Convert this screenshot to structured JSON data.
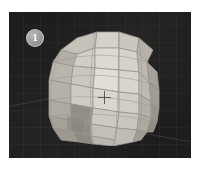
{
  "figure": {
    "name": "3d-viewport-figure",
    "badge_label": "1",
    "badge_title": "Panel 1",
    "caption": ""
  },
  "viewport": {
    "name": "3d-viewport",
    "background_color": "#1d1d1d",
    "grid_visible": true,
    "grid_color": "#787878",
    "cursor_label": "3D cursor"
  },
  "object": {
    "name": "uv-sphere-mesh",
    "shading": "flat",
    "wireframe_visible": true,
    "base_color": "#cfcbc4",
    "shadow_color": "#8f8c86",
    "highlight_color": "#e2dfd8",
    "edge_color": "#9a978f",
    "segments": 12,
    "rings": 8
  }
}
